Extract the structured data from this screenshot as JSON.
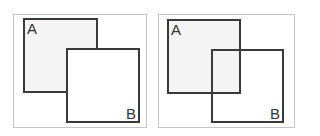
{
  "panels": [
    {
      "id": "left",
      "description": "B drawn on top of A (opaque)",
      "square_a": {
        "label": "A",
        "fill": "#f4f4f4"
      },
      "square_b": {
        "label": "B",
        "fill": "#ffffff"
      }
    },
    {
      "id": "right",
      "description": "B outline overlapping A (transparent)",
      "square_a": {
        "label": "A",
        "fill": "#f4f4f4"
      },
      "square_b": {
        "label": "B",
        "fill": "transparent"
      }
    }
  ],
  "colors": {
    "stroke": "#3a3a3a",
    "frame": "#c4c4c4"
  }
}
